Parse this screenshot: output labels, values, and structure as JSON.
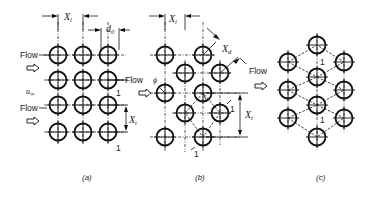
{
  "figure": {
    "panels": [
      {
        "id": "a",
        "caption": "(a)",
        "arrangement": "in-line",
        "labels": {
          "longitudinal_pitch": "X",
          "longitudinal_pitch_sub": "l",
          "diameter": "d",
          "diameter_sub": "0",
          "transverse_pitch": "X",
          "transverse_pitch_sub": "t",
          "flow_1": "Flow",
          "flow_2": "Flow",
          "velocity": "u",
          "velocity_sub": "∞",
          "cell_marker_1": "1",
          "cell_marker_2": "1"
        }
      },
      {
        "id": "b",
        "caption": "(b)",
        "arrangement": "staggered",
        "labels": {
          "longitudinal_pitch": "X",
          "longitudinal_pitch_sub": "l",
          "diagonal_pitch": "X",
          "diagonal_pitch_sub": "d",
          "transverse_pitch": "X",
          "transverse_pitch_sub": "t",
          "flow": "Flow",
          "angle": "ϕ",
          "cell_marker_1": "1",
          "cell_marker_2": "1"
        }
      },
      {
        "id": "c",
        "caption": "(c)",
        "arrangement": "hexagonal",
        "labels": {
          "flow": "Flow",
          "cell_marker_1": "1",
          "cell_marker_2": "1"
        }
      }
    ],
    "colors": {
      "line": "#111111",
      "background": "#ffffff"
    }
  }
}
